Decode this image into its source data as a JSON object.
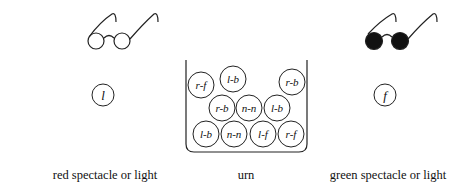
{
  "figure": {
    "left": {
      "spectacle": {
        "lens_fill": "#ffffff",
        "name": "red spectacle"
      },
      "token": "l",
      "caption": "red spectacle or light"
    },
    "center": {
      "caption": "urn",
      "balls": [
        {
          "label": "r-f",
          "cx": 201,
          "cy": 85
        },
        {
          "label": "l-b",
          "cx": 233,
          "cy": 79
        },
        {
          "label": "r-b",
          "cx": 292,
          "cy": 82
        },
        {
          "label": "r-b",
          "cx": 222,
          "cy": 108
        },
        {
          "label": "n-n",
          "cx": 249,
          "cy": 108
        },
        {
          "label": "l-b",
          "cx": 277,
          "cy": 108
        },
        {
          "label": "l-b",
          "cx": 206,
          "cy": 134
        },
        {
          "label": "n-n",
          "cx": 234,
          "cy": 134
        },
        {
          "label": "l-f",
          "cx": 263,
          "cy": 134
        },
        {
          "label": "r-f",
          "cx": 291,
          "cy": 134
        }
      ]
    },
    "right": {
      "spectacle": {
        "lens_fill": "#111111",
        "name": "green spectacle"
      },
      "token": "f",
      "caption": "green spectacle or light"
    }
  }
}
